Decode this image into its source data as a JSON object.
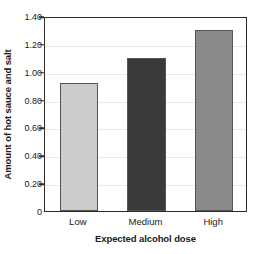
{
  "chart_data": {
    "type": "bar",
    "title": "",
    "xlabel": "Expected alcohol dose",
    "ylabel": "Amount of hot sauce and salt",
    "categories": [
      "Low",
      "Medium",
      "High"
    ],
    "values": [
      0.92,
      1.1,
      1.3
    ],
    "ylim": [
      0,
      1.4
    ],
    "ytick_values": [
      0,
      0.2,
      0.4,
      0.6,
      0.8,
      1.0,
      1.2,
      1.4
    ],
    "ytick_labels": [
      "0",
      "0.20",
      "0.40",
      "0.60",
      "0.80",
      "1.00",
      "1.20",
      "1.40"
    ],
    "bar_colors": [
      "#cccccc",
      "#3a3a3a",
      "#8a8a8a"
    ],
    "bar_border_color": "#555555",
    "grid": true,
    "grid_color": "#e8e8e8",
    "grid_axis": "y",
    "legend": "none",
    "frame_color": "#2b2b2b",
    "background": "#ffffff"
  }
}
